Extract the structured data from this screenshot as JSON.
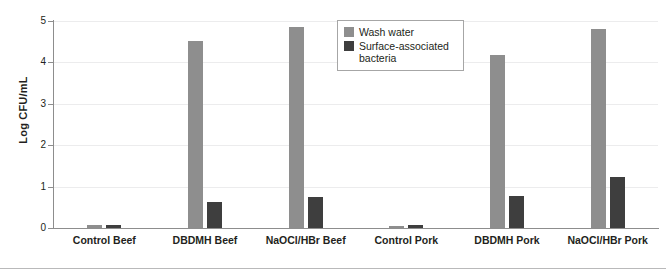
{
  "chart_data": {
    "type": "bar",
    "title": "",
    "xlabel": "",
    "ylabel": "Log CFU/mL",
    "ylim": [
      0,
      5
    ],
    "yticks": [
      "0",
      "1",
      "2",
      "3",
      "4",
      "5"
    ],
    "grid": true,
    "legend_position": "top-center",
    "categories": [
      "Control Beef",
      "DBDMH Beef",
      "NaOCl/HBr Beef",
      "Control Pork",
      "DBDMH Pork",
      "NaOCl/HBr Pork"
    ],
    "series": [
      {
        "name": "Wash water",
        "color": "#8e8e8e",
        "values": [
          0.07,
          4.52,
          4.86,
          0.06,
          4.17,
          4.81
        ]
      },
      {
        "name": "Surface-associated bacteria",
        "color": "#3e3e3e",
        "values": [
          0.07,
          0.63,
          0.76,
          0.08,
          0.78,
          1.23
        ]
      }
    ]
  },
  "legend": {
    "items": [
      {
        "label": "Wash water",
        "color": "#8e8e8e"
      },
      {
        "label": "Surface-associated bacteria",
        "color": "#3e3e3e"
      }
    ]
  },
  "colors": {
    "wash_water": "#8e8e8e",
    "surface_bacteria": "#3e3e3e",
    "axis": "#8d8d8d",
    "grid": "#ececed",
    "text": "#231f20"
  }
}
